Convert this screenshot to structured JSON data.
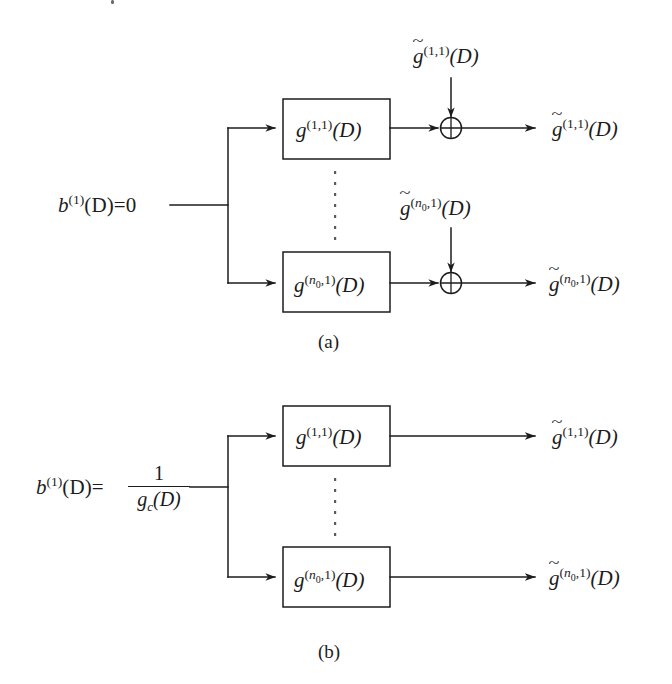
{
  "figure": {
    "background_color": "#ffffff",
    "line_color": "#1c1c1c",
    "panels": [
      {
        "id": "a",
        "label": "(a)",
        "input_label": "b",
        "input_superscript": "(1)",
        "input_arg": "(D)=0",
        "blocks": [
          {
            "base": "g",
            "superscript": "(1,1)",
            "arg": "(D)"
          },
          {
            "base": "g",
            "superscript": "(n0,1)",
            "arg": "(D)"
          }
        ],
        "noise_inputs": [
          {
            "base": "g",
            "tilde": true,
            "superscript": "(1,1)",
            "arg": "(D)"
          },
          {
            "base": "g",
            "tilde": true,
            "superscript": "(n0,1)",
            "arg": "(D)"
          }
        ],
        "adders": [
          {
            "symbol": "plus-circle"
          },
          {
            "symbol": "plus-circle"
          }
        ],
        "outputs": [
          {
            "base": "g",
            "tilde": true,
            "superscript": "(1,1)",
            "arg": "(D)"
          },
          {
            "base": "g",
            "tilde": true,
            "superscript": "(n0,1)",
            "arg": "(D)"
          }
        ],
        "ellipsis": "vertical-dots"
      },
      {
        "id": "b",
        "label": "(b)",
        "input_label": "b",
        "input_superscript": "(1)",
        "input_arg": "(D)=",
        "input_fraction": {
          "numerator": "1",
          "denominator_base": "g",
          "denominator_sub": "c",
          "denominator_arg": "(D)"
        },
        "blocks": [
          {
            "base": "g",
            "superscript": "(1,1)",
            "arg": "(D)"
          },
          {
            "base": "g",
            "superscript": "(n0,1)",
            "arg": "(D)"
          }
        ],
        "outputs": [
          {
            "base": "g",
            "tilde": true,
            "superscript": "(1,1)",
            "arg": "(D)"
          },
          {
            "base": "g",
            "tilde": true,
            "superscript": "(n0,1)",
            "arg": "(D)"
          }
        ],
        "ellipsis": "vertical-dots"
      }
    ]
  },
  "glyphs": {
    "tilde": "~",
    "n": "n",
    "zero": "0",
    "one": "1",
    "D": "D",
    "g": "g",
    "b": "b",
    "c": "c",
    "paren_open": "(",
    "paren_close": ")",
    "comma": ",",
    "equals_zero": "(D)=0",
    "equals": "(D)=",
    "arg_D": "(D)",
    "sup_11": "(1,1)",
    "sup_1": "(1)",
    "label_a": "(a)",
    "label_b": "(b)"
  }
}
